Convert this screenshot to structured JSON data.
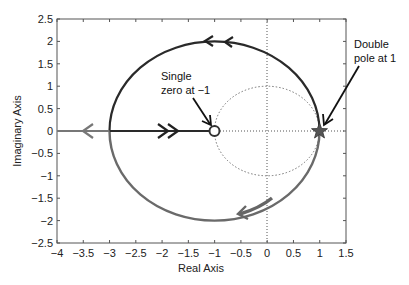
{
  "chart_data": {
    "type": "line",
    "title": "",
    "xlabel": "Real Axis",
    "ylabel": "Imaginary Axis",
    "xlim": [
      -4,
      1.5
    ],
    "ylim": [
      -2.5,
      2.5
    ],
    "xticks": [
      -4,
      -3.5,
      -3,
      -2.5,
      -2,
      -1.5,
      -1,
      -0.5,
      0,
      0.5,
      1,
      1.5
    ],
    "yticks": [
      -2.5,
      -2,
      -1.5,
      -1,
      -0.5,
      0,
      0.5,
      1,
      1.5,
      2,
      2.5
    ],
    "xtick_labels": [
      "−4",
      "−3.5",
      "−3",
      "−2.5",
      "−2",
      "−1.5",
      "−1",
      "−0.5",
      "0",
      "0.5",
      "1",
      "1.5"
    ],
    "ytick_labels": [
      "−2.5",
      "−2",
      "−1.5",
      "−1",
      "−0.5",
      "0",
      "0.5",
      "1",
      "1.5",
      "2",
      "2.5"
    ],
    "grid": false,
    "series": [
      {
        "name": "root-locus-circle",
        "shape": "circle",
        "center": [
          -1,
          0
        ],
        "radius": 2,
        "direction": "counterclockwise-from-pole",
        "color": "#333333"
      },
      {
        "name": "real-axis-segment-to-zero",
        "x": [
          -3,
          -1
        ],
        "y": [
          0,
          0
        ],
        "direction": "toward zero",
        "color": "#333333"
      },
      {
        "name": "real-axis-segment-to-left",
        "x": [
          -3,
          -4
        ],
        "y": [
          0,
          0
        ],
        "direction": "toward -infinity",
        "color": "#777777"
      },
      {
        "name": "unit-circle",
        "shape": "circle",
        "center": [
          0,
          0
        ],
        "radius": 1,
        "style": "dotted",
        "color": "#777777"
      },
      {
        "name": "imag-axis-line",
        "x": [
          0,
          0
        ],
        "y": [
          -2.5,
          2.5
        ],
        "style": "dotted"
      },
      {
        "name": "real-axis-line",
        "x": [
          -1,
          1.5
        ],
        "y": [
          0,
          0
        ],
        "style": "dotted"
      }
    ],
    "markers": [
      {
        "type": "zero",
        "symbol": "o",
        "x": -1,
        "y": 0
      },
      {
        "type": "pole",
        "symbol": "star",
        "x": 1,
        "y": 0,
        "multiplicity": 2
      }
    ],
    "annotations": [
      {
        "text_lines": [
          "Single",
          "zero at −1"
        ],
        "target": [
          -1,
          0
        ]
      },
      {
        "text_lines": [
          "Double",
          "pole at 1"
        ],
        "target": [
          1,
          0
        ]
      }
    ]
  }
}
